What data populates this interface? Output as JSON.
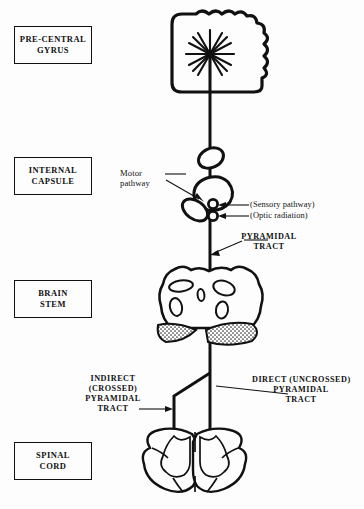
{
  "figure": {
    "background_color": "#fdfdfd",
    "ink_color": "#111111"
  },
  "region_labels": [
    {
      "id": "pre-central-gyrus",
      "line1": "PRE-CENTRAL",
      "line2": "GYRUS"
    },
    {
      "id": "internal-capsule",
      "line1": "INTERNAL",
      "line2": "CAPSULE"
    },
    {
      "id": "brain-stem",
      "line1": "BRAIN",
      "line2": "STEM"
    },
    {
      "id": "spinal-cord",
      "line1": "SPINAL",
      "line2": "CORD"
    }
  ],
  "annotations": {
    "motor_pathway": "Motor\npathway",
    "sensory_pathway": "(Sensory pathway)",
    "optic_radiation": "(Optic radiation)",
    "pyramidal_tract": "PYRAMIDAL\nTRACT",
    "indirect_tract": "INDIRECT\n(CROSSED)\nPYRAMIDAL\nTRACT",
    "direct_tract": "DIRECT (UNCROSSED)\nPYRAMIDAL\nTRACT"
  }
}
